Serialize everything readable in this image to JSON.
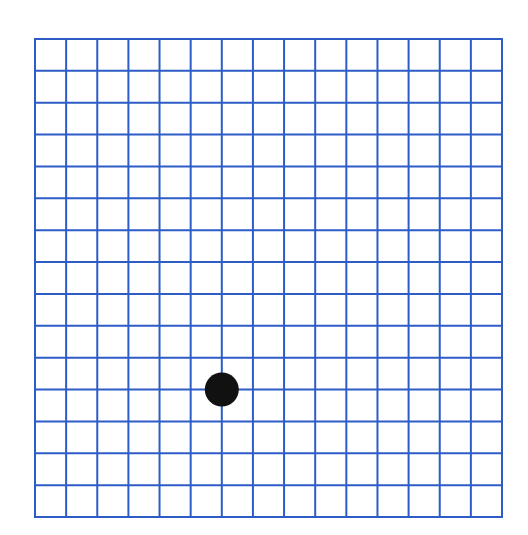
{
  "figure": {
    "type": "amsler-style-grid",
    "background_color": "#ffffff",
    "grid": {
      "columns": 15,
      "rows": 15,
      "left": 35,
      "top": 39,
      "right": 502,
      "bottom": 517,
      "line_color": "#2d5cc6",
      "line_width": 2
    },
    "fixation_dot": {
      "grid_col_line": 6,
      "grid_row_line": 11,
      "cx": 223,
      "cy": 392,
      "radius": 17,
      "color": "#111111"
    }
  }
}
